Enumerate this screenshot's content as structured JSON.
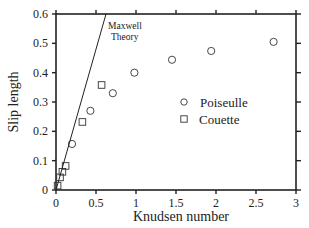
{
  "chart_data": {
    "type": "scatter",
    "title": "",
    "xlabel": "Knudsen number",
    "ylabel": "Slip length",
    "xlim": [
      0,
      3
    ],
    "ylim": [
      0,
      0.6
    ],
    "grid": false,
    "legend_position": "center-right",
    "x_ticks": [
      "0",
      "0.5",
      "1",
      "1.5",
      "2",
      "2.5",
      "3"
    ],
    "y_ticks": [
      "0",
      "0.1",
      "0.2",
      "0.3",
      "0.4",
      "0.5",
      "0.6"
    ],
    "series": [
      {
        "name": "Poiseulle",
        "marker": "circle",
        "points": [
          {
            "x": 0.2,
            "y": 0.157
          },
          {
            "x": 0.43,
            "y": 0.27
          },
          {
            "x": 0.71,
            "y": 0.33
          },
          {
            "x": 0.98,
            "y": 0.4
          },
          {
            "x": 1.45,
            "y": 0.444
          },
          {
            "x": 1.94,
            "y": 0.474
          },
          {
            "x": 2.72,
            "y": 0.505
          }
        ]
      },
      {
        "name": "Couette",
        "marker": "square",
        "points": [
          {
            "x": 0.02,
            "y": 0.015
          },
          {
            "x": 0.05,
            "y": 0.043
          },
          {
            "x": 0.08,
            "y": 0.062
          },
          {
            "x": 0.12,
            "y": 0.082
          },
          {
            "x": 0.33,
            "y": 0.232
          },
          {
            "x": 0.57,
            "y": 0.358
          }
        ]
      },
      {
        "name": "Maxwell Theory",
        "marker": "line",
        "points": [
          {
            "x": 0,
            "y": 0
          },
          {
            "x": 0.625,
            "y": 0.6
          }
        ]
      }
    ],
    "annotations": [
      {
        "text_line1": "Maxwell",
        "text_line2": "Theory",
        "x": 0.64,
        "y": 0.555
      }
    ]
  },
  "legend": {
    "items": [
      {
        "label": "Poiseulle",
        "marker": "circle"
      },
      {
        "label": "Couette",
        "marker": "square"
      }
    ]
  },
  "annotation": {
    "line1": "Maxwell",
    "line2": "Theory"
  },
  "axes": {
    "xlabel": "Knudsen number",
    "ylabel": "Slip length"
  }
}
